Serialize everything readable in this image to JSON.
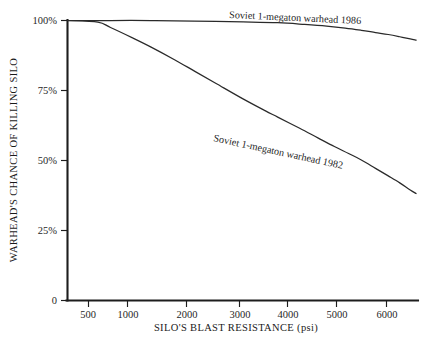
{
  "chart_data": {
    "type": "line",
    "title": "",
    "xlabel": "SILO'S BLAST RESISTANCE (psi)",
    "ylabel": "WARHEAD'S CHANCE OF KILLING SILO",
    "xscale": "log",
    "xlim": [
      350,
      6400
    ],
    "ylim": [
      0,
      100
    ],
    "grid": false,
    "legend_position": "inline-curve-labels",
    "xticks": [
      500,
      1000,
      2000,
      3000,
      4000,
      5000,
      6000
    ],
    "xtick_labels": [
      "500",
      "1000",
      "2000",
      "3000",
      "4000",
      "5000",
      "6000"
    ],
    "yticks": [
      0,
      25,
      50,
      75,
      100
    ],
    "ytick_labels": [
      "0",
      "25%",
      "50%",
      "75%",
      "100%"
    ],
    "series": [
      {
        "name": "Soviet 1-megaton warhead 1986",
        "label": "Soviet 1-megaton warhead 1986",
        "x": [
          350,
          500,
          700,
          1000,
          1500,
          2000,
          2500,
          3000,
          3500,
          4000,
          4500,
          5000,
          5500,
          6000,
          6300
        ],
        "values": [
          100,
          100,
          100,
          99.8,
          99.5,
          99.2,
          98.6,
          98.0,
          97.3,
          96.5,
          95.7,
          95.0,
          94.2,
          93.4,
          93.0
        ]
      },
      {
        "name": "Soviet 1-megaton warhead 1982",
        "label": "Soviet 1-megaton warhead 1982",
        "x": [
          350,
          450,
          500,
          600,
          700,
          850,
          1000,
          1200,
          1500,
          1800,
          2000,
          2400,
          2800,
          3200,
          3600,
          4000,
          4500,
          5000,
          5500,
          6000,
          6300
        ],
        "values": [
          100,
          99.4,
          97.5,
          93.8,
          90.5,
          86.0,
          82.0,
          77.5,
          72.0,
          67.8,
          65.5,
          61.5,
          58.0,
          55.0,
          52.5,
          50.2,
          47.2,
          44.5,
          42.0,
          39.5,
          38.2
        ]
      }
    ]
  },
  "axis": {
    "ylabel": "WARHEAD'S CHANCE OF KILLING SILO",
    "xlabel": "SILO'S BLAST RESISTANCE (psi)"
  },
  "colors": {
    "background": "#ffffff",
    "ink": "#1d1d1d",
    "curve": "#2a2a2a"
  }
}
